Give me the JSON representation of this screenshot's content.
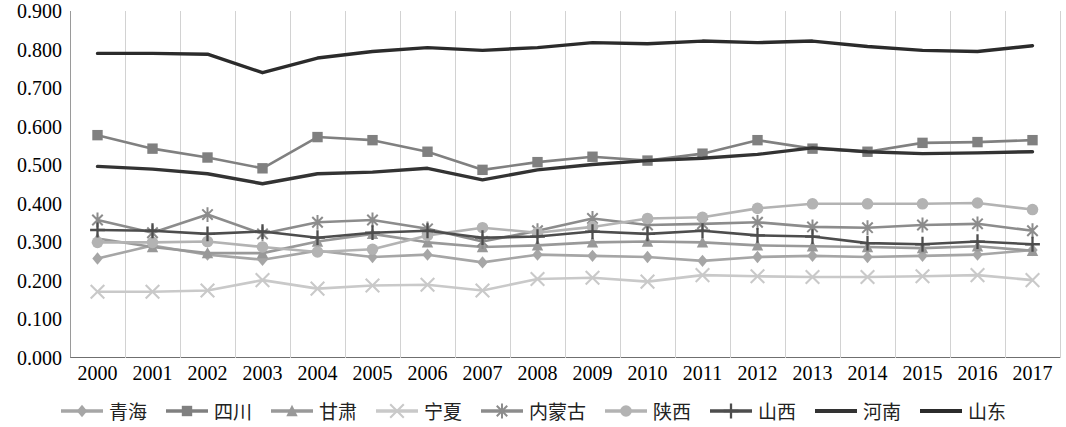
{
  "chart_data": {
    "type": "line",
    "title": "",
    "subtitle": "",
    "xlabel": "",
    "ylabel": "",
    "grid": "vertical",
    "legend_position": "bottom",
    "ylim": [
      0.0,
      0.9
    ],
    "ytick_labels": [
      "0.900",
      "0.800",
      "0.700",
      "0.600",
      "0.500",
      "0.400",
      "0.300",
      "0.200",
      "0.100",
      "0.000"
    ],
    "ytick_values": [
      0.9,
      0.8,
      0.7,
      0.6,
      0.5,
      0.4,
      0.3,
      0.2,
      0.1,
      0.0
    ],
    "categories": [
      "2000",
      "2001",
      "2002",
      "2003",
      "2004",
      "2005",
      "2006",
      "2007",
      "2008",
      "2009",
      "2010",
      "2011",
      "2012",
      "2013",
      "2014",
      "2015",
      "2016",
      "2017"
    ],
    "x": [
      2000,
      2001,
      2002,
      2003,
      2004,
      2005,
      2006,
      2007,
      2008,
      2009,
      2010,
      2011,
      2012,
      2013,
      2014,
      2015,
      2016,
      2017
    ],
    "series": [
      {
        "name": "青海",
        "marker": "diamond",
        "color": "#a6a6a6",
        "values": [
          0.258,
          0.292,
          0.268,
          0.255,
          0.278,
          0.262,
          0.268,
          0.248,
          0.268,
          0.265,
          0.262,
          0.252,
          0.262,
          0.265,
          0.262,
          0.265,
          0.268,
          0.28
        ]
      },
      {
        "name": "四川",
        "marker": "square",
        "color": "#808080",
        "values": [
          0.578,
          0.543,
          0.52,
          0.492,
          0.573,
          0.565,
          0.535,
          0.488,
          0.508,
          0.522,
          0.512,
          0.53,
          0.565,
          0.543,
          0.535,
          0.558,
          0.56,
          0.565
        ]
      },
      {
        "name": "甘肃",
        "marker": "triangle",
        "color": "#999999",
        "values": [
          0.31,
          0.288,
          0.272,
          0.272,
          0.302,
          0.322,
          0.3,
          0.288,
          0.292,
          0.3,
          0.302,
          0.3,
          0.292,
          0.29,
          0.288,
          0.285,
          0.29,
          0.278
        ]
      },
      {
        "name": "宁夏",
        "marker": "x",
        "color": "#c9c9c9",
        "values": [
          0.172,
          0.172,
          0.175,
          0.202,
          0.18,
          0.188,
          0.19,
          0.175,
          0.205,
          0.208,
          0.198,
          0.215,
          0.212,
          0.21,
          0.21,
          0.212,
          0.215,
          0.202
        ]
      },
      {
        "name": "内蒙古",
        "marker": "asterisk",
        "color": "#8c8c8c",
        "values": [
          0.358,
          0.325,
          0.372,
          0.322,
          0.352,
          0.358,
          0.335,
          0.302,
          0.33,
          0.362,
          0.345,
          0.348,
          0.352,
          0.34,
          0.338,
          0.345,
          0.348,
          0.33
        ]
      },
      {
        "name": "陕西",
        "marker": "circle",
        "color": "#b3b3b3",
        "values": [
          0.3,
          0.3,
          0.302,
          0.288,
          0.275,
          0.282,
          0.318,
          0.338,
          0.325,
          0.34,
          0.362,
          0.365,
          0.388,
          0.4,
          0.4,
          0.4,
          0.402,
          0.385
        ]
      },
      {
        "name": "山西",
        "marker": "plus",
        "color": "#4d4d4d",
        "values": [
          0.332,
          0.33,
          0.322,
          0.328,
          0.312,
          0.325,
          0.33,
          0.312,
          0.315,
          0.328,
          0.322,
          0.33,
          0.318,
          0.315,
          0.298,
          0.295,
          0.302,
          0.295
        ]
      },
      {
        "name": "河南",
        "marker": "none",
        "color": "#333333",
        "values": [
          0.497,
          0.49,
          0.478,
          0.452,
          0.478,
          0.482,
          0.492,
          0.462,
          0.488,
          0.502,
          0.512,
          0.518,
          0.528,
          0.545,
          0.535,
          0.53,
          0.532,
          0.535
        ]
      },
      {
        "name": "山东",
        "marker": "none",
        "color": "#2b2b2b",
        "values": [
          0.79,
          0.79,
          0.788,
          0.74,
          0.778,
          0.795,
          0.805,
          0.798,
          0.805,
          0.818,
          0.815,
          0.822,
          0.818,
          0.822,
          0.808,
          0.798,
          0.795,
          0.81
        ]
      }
    ]
  },
  "legend": {
    "items": [
      {
        "label": "青海"
      },
      {
        "label": "四川"
      },
      {
        "label": "甘肃"
      },
      {
        "label": "宁夏"
      },
      {
        "label": "内蒙古"
      },
      {
        "label": "陕西"
      },
      {
        "label": "山西"
      },
      {
        "label": "河南"
      },
      {
        "label": "山东"
      }
    ]
  }
}
